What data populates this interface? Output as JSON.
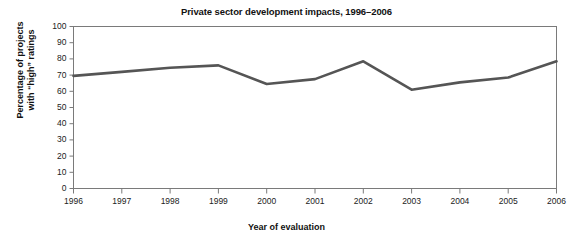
{
  "chart_data": {
    "type": "line",
    "title": "Private sector development impacts, 1996–2006",
    "xlabel": "Year of evaluation",
    "ylabel": "Percentage of projects with \"high\" ratings",
    "ylabel_line1": "Percentage of projects",
    "ylabel_line2": "with “high” ratings",
    "categories": [
      "1996",
      "1997",
      "1998",
      "1999",
      "2000",
      "2001",
      "2002",
      "2003",
      "2004",
      "2005",
      "2006"
    ],
    "values": [
      69.5,
      72,
      74.5,
      76,
      64.5,
      67.5,
      78.5,
      61,
      65.5,
      68.5,
      78.5
    ],
    "series": [
      {
        "name": "Percentage of projects with \"high\" ratings",
        "values": [
          69.5,
          72,
          74.5,
          76,
          64.5,
          67.5,
          78.5,
          61,
          65.5,
          68.5,
          78.5
        ],
        "color": "#555555"
      }
    ],
    "ylim": [
      0,
      100
    ],
    "ytick_step": 10,
    "yticks": [
      "100",
      "90",
      "80",
      "70",
      "60",
      "50",
      "40",
      "30",
      "20",
      "10",
      "0"
    ],
    "xticks": [
      "1996",
      "1997",
      "1998",
      "1999",
      "2000",
      "2001",
      "2002",
      "2003",
      "2004",
      "2005",
      "2006"
    ],
    "grid": false,
    "legend": "none",
    "line_color": "#555555",
    "axis_color": "#7a7a7a",
    "background_color": "#ffffff",
    "text_color": "#111111"
  }
}
